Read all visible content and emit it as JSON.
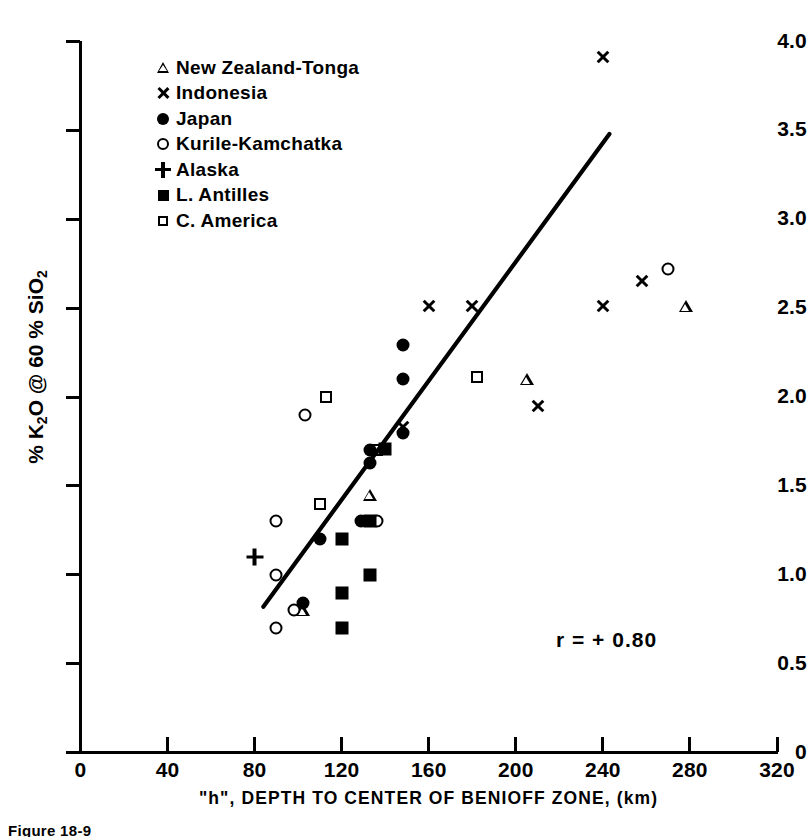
{
  "chart_data": {
    "type": "scatter",
    "title": "",
    "xlabel": "\"h\", DEPTH  TO CENTER OF BENIOFF ZONE, (km)",
    "ylabel": "% K2O @ 60 % SiO2",
    "xlim": [
      0,
      320
    ],
    "ylim": [
      0,
      4.0
    ],
    "xticks": [
      0,
      40,
      80,
      120,
      160,
      200,
      240,
      280,
      320
    ],
    "xticklabels": [
      "0",
      "40",
      "80",
      "120",
      "160",
      "200",
      "240",
      "280",
      "320"
    ],
    "yticks": [
      0,
      0.5,
      1.0,
      1.5,
      2.0,
      2.5,
      3.0,
      3.5,
      4.0
    ],
    "yticklabels": [
      "0",
      "0.5",
      "1.0",
      "1.5",
      "2.0",
      "2.5",
      "3.0",
      "3.5",
      "4.0"
    ],
    "grid": false,
    "legend_position": "upper-left",
    "annotation": "r = + 0.80",
    "caption": "Figure 18-9",
    "trendline": {
      "x_start": 84,
      "y_start": 0.82,
      "x_end": 243,
      "y_end": 3.48
    },
    "series": [
      {
        "name": "New Zealand-Tonga",
        "marker": "open-triangle",
        "points": [
          {
            "x": 102,
            "y": 0.8
          },
          {
            "x": 133,
            "y": 1.45
          },
          {
            "x": 205,
            "y": 2.1
          },
          {
            "x": 278,
            "y": 2.51
          }
        ]
      },
      {
        "name": "Indonesia",
        "marker": "cross",
        "points": [
          {
            "x": 148,
            "y": 1.83
          },
          {
            "x": 160,
            "y": 2.51
          },
          {
            "x": 180,
            "y": 2.51
          },
          {
            "x": 210,
            "y": 1.95
          },
          {
            "x": 240,
            "y": 3.91
          },
          {
            "x": 240,
            "y": 2.51
          },
          {
            "x": 258,
            "y": 2.65
          }
        ]
      },
      {
        "name": "Japan",
        "marker": "filled-circle",
        "points": [
          {
            "x": 102,
            "y": 0.84
          },
          {
            "x": 110,
            "y": 1.2
          },
          {
            "x": 129,
            "y": 1.3
          },
          {
            "x": 133,
            "y": 1.63
          },
          {
            "x": 133,
            "y": 1.7
          },
          {
            "x": 148,
            "y": 1.8
          },
          {
            "x": 148,
            "y": 2.1
          },
          {
            "x": 148,
            "y": 2.29
          }
        ]
      },
      {
        "name": "Kurile-Kamchatka",
        "marker": "open-circle",
        "points": [
          {
            "x": 90,
            "y": 0.7
          },
          {
            "x": 90,
            "y": 1.0
          },
          {
            "x": 90,
            "y": 1.3
          },
          {
            "x": 98,
            "y": 0.8
          },
          {
            "x": 103,
            "y": 1.9
          },
          {
            "x": 136,
            "y": 1.3
          },
          {
            "x": 270,
            "y": 2.72
          }
        ]
      },
      {
        "name": "Alaska",
        "marker": "plus",
        "points": [
          {
            "x": 80,
            "y": 1.1
          }
        ]
      },
      {
        "name": "L. Antilles",
        "marker": "filled-square",
        "points": [
          {
            "x": 120,
            "y": 0.7
          },
          {
            "x": 120,
            "y": 0.9
          },
          {
            "x": 120,
            "y": 1.2
          },
          {
            "x": 133,
            "y": 1.0
          },
          {
            "x": 133,
            "y": 1.3
          },
          {
            "x": 140,
            "y": 1.71
          }
        ]
      },
      {
        "name": "C. America",
        "marker": "open-square",
        "points": [
          {
            "x": 110,
            "y": 1.4
          },
          {
            "x": 113,
            "y": 2.0
          },
          {
            "x": 136,
            "y": 1.7
          },
          {
            "x": 182,
            "y": 2.11
          }
        ]
      }
    ]
  }
}
